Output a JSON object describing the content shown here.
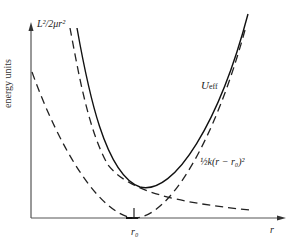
{
  "diagram": {
    "y_axis_label": "energy units",
    "x_axis_label": "r",
    "tick_label": "r₀",
    "curves": [
      {
        "name": "centrifugal",
        "label": "L²/2μr²",
        "style": "dashed"
      },
      {
        "name": "effective",
        "label": "U_eff",
        "style": "solid"
      },
      {
        "name": "harmonic",
        "label": "½k(r − r₀)²",
        "style": "dashed"
      }
    ]
  },
  "labels": {
    "centrifugal": "L²/2μr²",
    "ueff_main": "U",
    "ueff_sub": "eff",
    "harmonic": "½k(r − r₀)²",
    "r0": "r₀",
    "r": "r",
    "energy": "energy units"
  },
  "colors": {
    "ink": "#222222",
    "background": "#ffffff"
  }
}
